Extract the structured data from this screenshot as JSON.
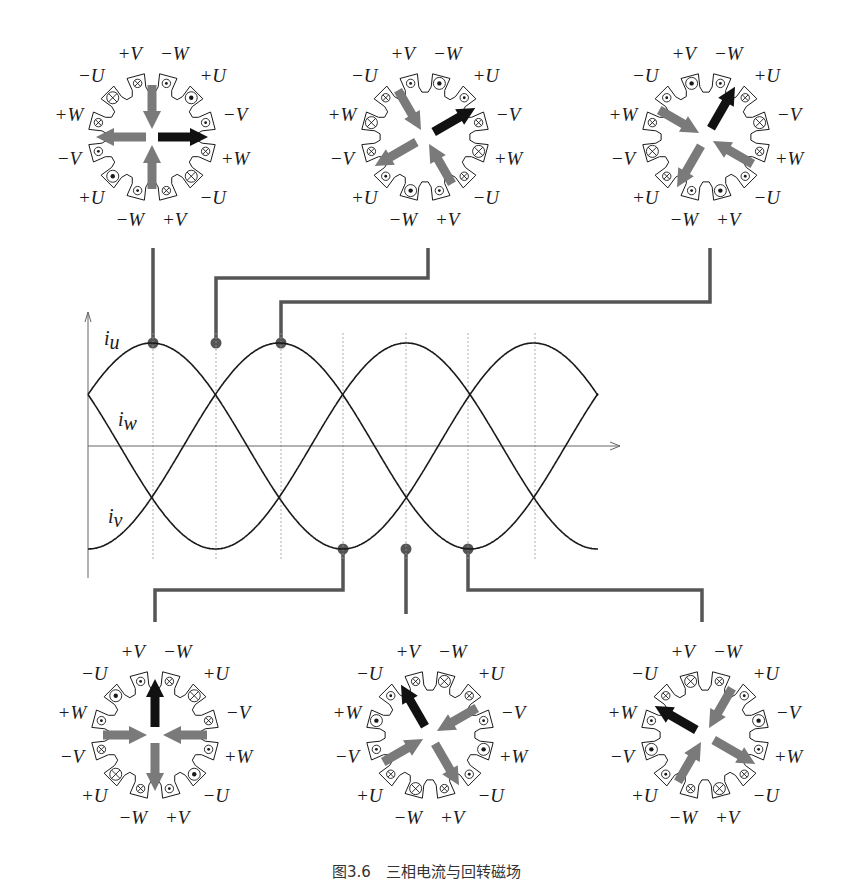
{
  "figure": {
    "caption": "图3.6　三相电流与回转磁场",
    "colors": {
      "stroke": "#1a1a1a",
      "connector": "#555555",
      "arrow_gray": "#7a7a7a",
      "arrow_black": "#111111",
      "grid": "#9a9a9a"
    }
  },
  "slot_labels": [
    "+V",
    "−W",
    "+U",
    "−V",
    "+W",
    "−U",
    "+V",
    "−W",
    "+U",
    "−V",
    "+W",
    "−U"
  ],
  "slot_angles_deg": [
    -15,
    15,
    45,
    75,
    105,
    135,
    165,
    195,
    225,
    255,
    285,
    315
  ],
  "motors": [
    {
      "id": "motor-1",
      "center": [
        152,
        137
      ],
      "slots": [
        "xs",
        "ds",
        "dL",
        "ds",
        "xs",
        "xL",
        "xs",
        "ds",
        "dL",
        "ds",
        "xs",
        "xL"
      ],
      "arrows": [
        {
          "color": "black",
          "angle": 90,
          "r0": 6,
          "r1": 56
        },
        {
          "color": "gray",
          "angle": 180,
          "r0": 52,
          "r1": 8
        },
        {
          "color": "gray",
          "angle": 270,
          "r0": 6,
          "r1": 56
        },
        {
          "color": "gray",
          "angle": 0,
          "r0": 52,
          "r1": 8
        }
      ]
    },
    {
      "id": "motor-2",
      "center": [
        425,
        137
      ],
      "slots": [
        "ds",
        "dL",
        "ds",
        "xs",
        "xL",
        "xs",
        "ds",
        "dL",
        "ds",
        "xs",
        "xL",
        "xs"
      ],
      "arrows": [
        {
          "color": "black",
          "angle": 60,
          "r0": 10,
          "r1": 58
        },
        {
          "color": "gray",
          "angle": 150,
          "r0": 54,
          "r1": 8
        },
        {
          "color": "gray",
          "angle": 240,
          "r0": 10,
          "r1": 58
        },
        {
          "color": "gray",
          "angle": 330,
          "r0": 54,
          "r1": 8
        }
      ]
    },
    {
      "id": "motor-3",
      "center": [
        706,
        137
      ],
      "slots": [
        "dL",
        "ds",
        "xs",
        "xL",
        "xs",
        "ds",
        "dL",
        "ds",
        "xs",
        "xL",
        "xs",
        "ds"
      ],
      "arrows": [
        {
          "color": "black",
          "angle": 30,
          "r0": 10,
          "r1": 58
        },
        {
          "color": "gray",
          "angle": 120,
          "r0": 54,
          "r1": 8
        },
        {
          "color": "gray",
          "angle": 210,
          "r0": 10,
          "r1": 58
        },
        {
          "color": "gray",
          "angle": 300,
          "r0": 54,
          "r1": 8
        }
      ]
    },
    {
      "id": "motor-4",
      "center": [
        155,
        735
      ],
      "slots": [
        "ds",
        "xs",
        "xL",
        "xs",
        "ds",
        "dL",
        "ds",
        "xs",
        "xL",
        "xs",
        "ds",
        "dL"
      ],
      "arrows": [
        {
          "color": "black",
          "angle": 0,
          "r0": 8,
          "r1": 56
        },
        {
          "color": "gray",
          "angle": 90,
          "r0": 52,
          "r1": 8
        },
        {
          "color": "gray",
          "angle": 180,
          "r0": 8,
          "r1": 56
        },
        {
          "color": "gray",
          "angle": 270,
          "r0": 52,
          "r1": 8
        }
      ]
    },
    {
      "id": "motor-5",
      "center": [
        430,
        735
      ],
      "slots": [
        "xs",
        "xL",
        "xs",
        "ds",
        "dL",
        "ds",
        "xs",
        "xL",
        "xs",
        "ds",
        "dL",
        "ds"
      ],
      "arrows": [
        {
          "color": "black",
          "angle": -30,
          "r0": 10,
          "r1": 58
        },
        {
          "color": "gray",
          "angle": 60,
          "r0": 54,
          "r1": 8
        },
        {
          "color": "gray",
          "angle": 150,
          "r0": 10,
          "r1": 58
        },
        {
          "color": "gray",
          "angle": 240,
          "r0": 54,
          "r1": 8
        }
      ]
    },
    {
      "id": "motor-6",
      "center": [
        705,
        735
      ],
      "slots": [
        "xL",
        "xs",
        "ds",
        "dL",
        "ds",
        "xs",
        "xL",
        "xs",
        "ds",
        "dL",
        "ds",
        "xs"
      ],
      "arrows": [
        {
          "color": "black",
          "angle": -60,
          "r0": 10,
          "r1": 58
        },
        {
          "color": "gray",
          "angle": 30,
          "r0": 54,
          "r1": 8
        },
        {
          "color": "gray",
          "angle": 120,
          "r0": 10,
          "r1": 58
        },
        {
          "color": "gray",
          "angle": 210,
          "r0": 54,
          "r1": 8
        }
      ]
    }
  ],
  "plot": {
    "origin_x": 88,
    "zero_y": 446,
    "amplitude": 103,
    "x_end": 598,
    "axis_arrow_end_x": 620,
    "y_axis_top": 312,
    "y_axis_bottom": 578,
    "period_px": 382,
    "start_phase_deg": 30,
    "labels": [
      {
        "name": "u",
        "text": "i",
        "sub": "u",
        "x": 104,
        "y": 345
      },
      {
        "name": "w",
        "text": "i",
        "sub": "w",
        "x": 118,
        "y": 426
      },
      {
        "name": "v",
        "text": "i",
        "sub": "v",
        "x": 108,
        "y": 523
      }
    ],
    "dotted_x": [
      153,
      216,
      281,
      343,
      406,
      468,
      535
    ],
    "markers": [
      {
        "x": 153,
        "y": 343,
        "connect_to": [
          153,
          248
        ],
        "path": "straight"
      },
      {
        "x": 216,
        "y": 343,
        "connect_to": [
          428,
          248
        ],
        "path": "elbow",
        "elbow_y": 278
      },
      {
        "x": 281,
        "y": 343,
        "connect_to": [
          710,
          248
        ],
        "path": "elbow",
        "elbow_y": 302
      },
      {
        "x": 343,
        "y": 549,
        "connect_to": [
          155,
          622
        ],
        "path": "elbow",
        "elbow_y": 590
      },
      {
        "x": 406,
        "y": 549,
        "connect_to": [
          406,
          614
        ],
        "path": "straight"
      },
      {
        "x": 468,
        "y": 549,
        "connect_to": [
          702,
          622
        ],
        "path": "elbow",
        "elbow_y": 590
      }
    ]
  },
  "chart_data": {
    "type": "line",
    "xlabel": "",
    "ylabel": "",
    "series": [
      {
        "name": "i_u",
        "phase_deg": 0
      },
      {
        "name": "i_v",
        "phase_deg": -120
      },
      {
        "name": "i_w",
        "phase_deg": 120
      }
    ],
    "sample_instants_deg": [
      90,
      150,
      210,
      270,
      330,
      390
    ],
    "grid": "dotted vertical markers"
  }
}
